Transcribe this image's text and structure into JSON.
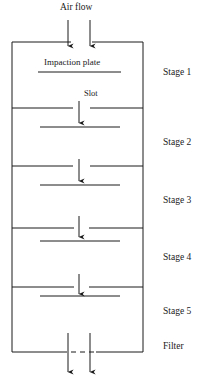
{
  "diagram": {
    "inlet": {
      "label": "Air flow",
      "label_x": 60,
      "label_y": 3,
      "arrow_xs": [
        68,
        90
      ],
      "arrow_top": 20,
      "arrow_bottom": 46
    },
    "body": {
      "left": 12,
      "right": 143,
      "top": 42,
      "bottom": 352,
      "stroke": "#1a1a1a",
      "stroke_width": 1
    },
    "annotations": [
      {
        "name": "impaction-plate-label",
        "text": "Impaction plate",
        "x": 44,
        "y": 58,
        "class": "plate-label"
      },
      {
        "name": "slot-label",
        "text": "Slot",
        "x": 84,
        "y": 89,
        "class": "slot-label"
      }
    ],
    "stages": [
      {
        "name": "Stage 1",
        "label": "Stage 1",
        "label_x": 163,
        "label_y": 68,
        "divider_y": 42,
        "slot_left": 71,
        "slot_right": 92,
        "plate_y": 72,
        "plate_left": 38,
        "plate_right": 121,
        "arrow_x": 79,
        "arrow_top": 0,
        "arrow_bottom": 0
      },
      {
        "name": "Stage 2",
        "label": "Stage 2",
        "label_x": 163,
        "label_y": 138,
        "divider_y": 108,
        "slot_left": 73,
        "slot_right": 90,
        "plate_y": 127,
        "plate_left": 40,
        "plate_right": 120,
        "arrow_x": 79,
        "arrow_top": 101,
        "arrow_bottom": 123
      },
      {
        "name": "Stage 3",
        "label": "Stage 3",
        "label_x": 163,
        "label_y": 196,
        "divider_y": 166,
        "slot_left": 73,
        "slot_right": 90,
        "plate_y": 185,
        "plate_left": 40,
        "plate_right": 120,
        "arrow_x": 79,
        "arrow_top": 159,
        "arrow_bottom": 181
      },
      {
        "name": "Stage 4",
        "label": "Stage 4",
        "label_x": 163,
        "label_y": 253,
        "divider_y": 228,
        "slot_left": 74,
        "slot_right": 89,
        "plate_y": 241,
        "plate_left": 40,
        "plate_right": 120,
        "arrow_x": 79,
        "arrow_top": 216,
        "arrow_bottom": 237
      },
      {
        "name": "Stage 5",
        "label": "Stage 5",
        "label_x": 163,
        "label_y": 307,
        "divider_y": 287,
        "slot_left": 74,
        "slot_right": 89,
        "plate_y": 296,
        "plate_left": 40,
        "plate_right": 120,
        "arrow_x": 79,
        "arrow_top": 274,
        "arrow_bottom": 294
      }
    ],
    "filter": {
      "label": "Filter",
      "label_x": 163,
      "label_y": 342,
      "line_y": 352,
      "dash_left": 62,
      "dash_right": 96,
      "solid_left_end": 62,
      "solid_right_start": 96
    },
    "outlet": {
      "arrow_xs": [
        68,
        90
      ],
      "arrow_top": 333,
      "arrow_bottom": 372
    }
  }
}
